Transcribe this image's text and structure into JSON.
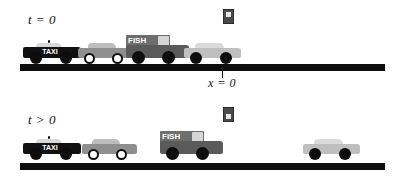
{
  "figure": {
    "background_color": "#ffffff",
    "width": 405,
    "height": 177
  },
  "colors": {
    "road": "#0d0d0d",
    "taxi_body": "#111111",
    "taxi_cabin": "#d8d8d8",
    "car_grey_body": "#8f8f8f",
    "car_grey_cabin": "#bdbdbd",
    "truck_body": "#5a5a5a",
    "truck_box": "#6e6e6e",
    "truck_window": "#d5d5d5",
    "car_light_body": "#bfbfbf",
    "car_light_cabin": "#dadada",
    "wheel_dark": "#0d0d0d",
    "wheel_hollow": "#ffffff",
    "traffic_light_housing": "#4a4a4a",
    "traffic_light_lamp": "#e8e8e8",
    "text": "#111111"
  },
  "panels": [
    {
      "id": "panel-top",
      "time_label": "t = 0",
      "position_label": "x = 0",
      "position_tick": true,
      "traffic_light": {
        "state": "red",
        "label": "traffic-light-red"
      },
      "road": {
        "x": 20,
        "width": 365,
        "height": 7
      },
      "vehicles": [
        {
          "name": "taxi",
          "sign": "TAXI",
          "x": 23,
          "width": 58,
          "type": "taxi"
        },
        {
          "name": "car-grey",
          "sign": "",
          "x": 78,
          "width": 55,
          "type": "car-grey"
        },
        {
          "name": "fish-truck",
          "sign": "FISH",
          "x": 126,
          "width": 63,
          "type": "truck"
        },
        {
          "name": "car-light",
          "sign": "",
          "x": 184,
          "width": 57,
          "type": "car-light"
        }
      ]
    },
    {
      "id": "panel-bot",
      "time_label": "t > 0",
      "position_label": "",
      "position_tick": false,
      "traffic_light": {
        "state": "green",
        "label": "traffic-light-green"
      },
      "road": {
        "x": 20,
        "width": 365,
        "height": 7
      },
      "vehicles": [
        {
          "name": "taxi",
          "sign": "TAXI",
          "x": 23,
          "width": 58,
          "type": "taxi"
        },
        {
          "name": "car-grey",
          "sign": "",
          "x": 82,
          "width": 55,
          "type": "car-grey"
        },
        {
          "name": "fish-truck",
          "sign": "FISH",
          "x": 160,
          "width": 63,
          "type": "truck"
        },
        {
          "name": "car-light",
          "sign": "",
          "x": 303,
          "width": 57,
          "type": "car-light"
        }
      ]
    }
  ]
}
